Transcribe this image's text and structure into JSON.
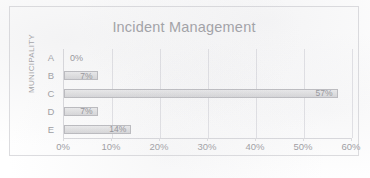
{
  "chart_data": {
    "type": "bar",
    "orientation": "horizontal",
    "title": "Incident Management",
    "xlabel": "",
    "ylabel": "MUNICIPALITY",
    "categories": [
      "A",
      "B",
      "C",
      "D",
      "E"
    ],
    "values": [
      0,
      7,
      57,
      7,
      14
    ],
    "data_labels": [
      "0%",
      "7%",
      "57%",
      "7%",
      "14%"
    ],
    "xlim": [
      0,
      60
    ],
    "xticks": [
      0,
      10,
      20,
      30,
      40,
      50,
      60
    ],
    "xticklabels": [
      "0%",
      "10%",
      "20%",
      "30%",
      "40%",
      "50%",
      "60%"
    ],
    "value_unit": "%",
    "grid": "vertical",
    "legend": "none",
    "colors": {
      "bar_fill": "#e2e2e3",
      "bar_border": "#b9b9bd",
      "title_text": "#9a9a9e",
      "axis_text": "#9b9b9f",
      "gridline": "#e2e2e6",
      "plot_background": "#fefefe",
      "frame_border": "#dcdcdf"
    }
  },
  "footnote": ""
}
